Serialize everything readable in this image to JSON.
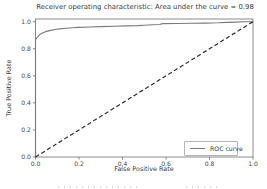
{
  "figure": {
    "title": "Receiver operating characteristic: Area under the curve = 0.98",
    "xlabel": "False Positive Rate",
    "ylabel": "True Positive Rate",
    "legend": {
      "label": "ROC curve"
    }
  },
  "colors": {
    "background": "#ffffff",
    "roc_curve": "#7a7a7a",
    "diagonal": "#2e2e2e",
    "spine": "#6e6e6e",
    "legend_border": "#b5b5b5",
    "text": "#3c3c3c"
  },
  "chart_data": {
    "type": "line",
    "title": "Receiver operating characteristic: Area under the curve = 0.98",
    "xlabel": "False Positive Rate",
    "ylabel": "True Positive Rate",
    "auc": 0.98,
    "xlim": [
      0.0,
      1.0
    ],
    "ylim": [
      0.0,
      1.02
    ],
    "x_ticks": [
      "0.0",
      "0.2",
      "0.4",
      "0.6",
      "0.8",
      "1.0"
    ],
    "y_ticks": [
      "0.0",
      "0.2",
      "0.4",
      "0.6",
      "0.8",
      "1.0"
    ],
    "grid": false,
    "legend_position": "lower right",
    "series": [
      {
        "name": "ROC curve",
        "style": "solid",
        "color": "#7a7a7a",
        "points": [
          [
            0.0,
            0.0
          ],
          [
            0.0,
            0.868
          ],
          [
            0.005,
            0.878
          ],
          [
            0.01,
            0.888
          ],
          [
            0.015,
            0.898
          ],
          [
            0.02,
            0.906
          ],
          [
            0.03,
            0.915
          ],
          [
            0.04,
            0.922
          ],
          [
            0.05,
            0.928
          ],
          [
            0.07,
            0.936
          ],
          [
            0.09,
            0.942
          ],
          [
            0.11,
            0.947
          ],
          [
            0.14,
            0.952
          ],
          [
            0.17,
            0.955
          ],
          [
            0.2,
            0.958
          ],
          [
            0.25,
            0.961
          ],
          [
            0.3,
            0.964
          ],
          [
            0.36,
            0.967
          ],
          [
            0.42,
            0.969
          ],
          [
            0.47,
            0.971
          ],
          [
            0.5,
            0.974
          ],
          [
            0.54,
            0.977
          ],
          [
            0.57,
            0.979
          ],
          [
            0.585,
            0.986
          ],
          [
            0.65,
            0.987
          ],
          [
            0.72,
            0.989
          ],
          [
            0.78,
            0.99
          ],
          [
            0.84,
            0.992
          ],
          [
            0.88,
            0.995
          ],
          [
            0.92,
            0.997
          ],
          [
            0.96,
            0.999
          ],
          [
            1.0,
            1.0
          ]
        ]
      },
      {
        "name": "chance-diagonal",
        "style": "dashed",
        "color": "#2e2e2e",
        "points": [
          [
            0.0,
            0.0
          ],
          [
            1.0,
            1.0
          ]
        ]
      }
    ]
  }
}
